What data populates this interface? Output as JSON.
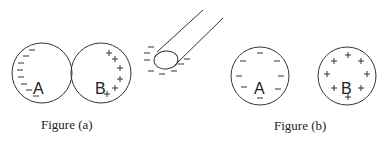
{
  "figure_a": {
    "caption": "Figure (a)",
    "sphere_a": {
      "label": "A",
      "charge": "negative",
      "sign": "–"
    },
    "sphere_b": {
      "label": "B",
      "charge": "positive",
      "sign": "+"
    },
    "rod": {
      "charge": "negative",
      "sign": "–"
    }
  },
  "figure_b": {
    "caption": "Figure (b)",
    "sphere_a": {
      "label": "A",
      "charge": "negative",
      "sign": "–"
    },
    "sphere_b": {
      "label": "B",
      "charge": "positive",
      "sign": "+"
    }
  },
  "colors": {
    "stroke": "#333333",
    "background": "#ffffff"
  }
}
